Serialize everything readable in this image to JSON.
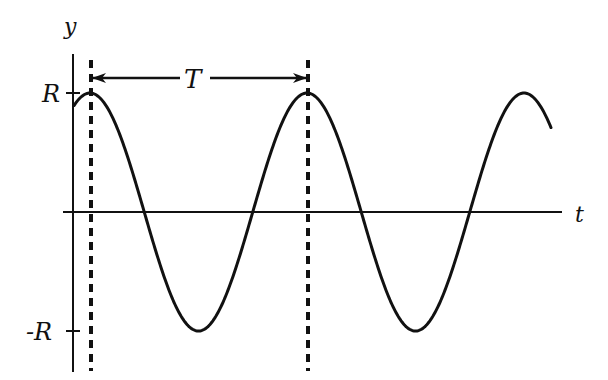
{
  "diagram": {
    "axes": {
      "y_label": "y",
      "x_label": "t",
      "y_ticks": [
        {
          "label": "R",
          "value": 1
        },
        {
          "label": "-R",
          "value": -1
        }
      ]
    },
    "period_label": "T",
    "curve": {
      "type": "cosine",
      "amplitude_label": "R",
      "cycles_shown": 2.2
    },
    "colors": {
      "stroke": "#111111",
      "background": "#ffffff"
    }
  }
}
